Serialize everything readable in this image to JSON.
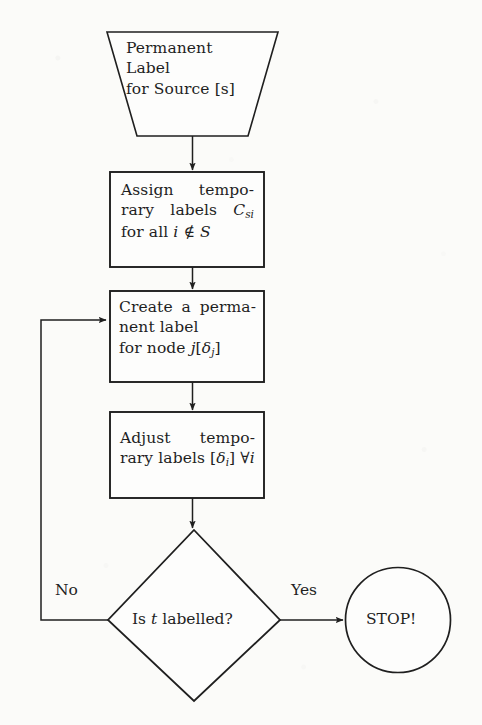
{
  "diagram": {
    "background_color": "#fbfbf9",
    "stroke_color": "#1f1f1f",
    "text_color": "#1f1f1f"
  },
  "nodes": {
    "start": {
      "shape": "trapezoid",
      "lines": [
        "Permanent",
        "Label",
        "for Source [s]"
      ],
      "line1": "Permanent",
      "line2": "Label",
      "line3": "for Source [s]"
    },
    "assign": {
      "shape": "rectangle",
      "line1_left": "Assign",
      "line1_right": "tempo-",
      "line2_left": "rary",
      "line2_mid": "labels",
      "line2_math_base": "C",
      "line2_math_sub": "si",
      "line3_pre": "for all ",
      "line3_math_i": "i",
      "line3_mid": " ∉ ",
      "line3_math_S": "S"
    },
    "create": {
      "shape": "rectangle",
      "line1_left": "Create",
      "line1_mid": "a",
      "line1_right": "perma-",
      "line2": "nent label",
      "line3_pre": "for node ",
      "line3_math_j": "j",
      "line3_bracket_open": "[",
      "line3_math_delta": "δ",
      "line3_math_delta_sub": "j",
      "line3_bracket_close": "]"
    },
    "adjust": {
      "shape": "rectangle",
      "line1_left": "Adjust",
      "line1_right": "tempo-",
      "line2_left": "rary",
      "line2_mid": "labels",
      "line2_bracket_open": "[",
      "line2_math_delta": "δ",
      "line2_math_delta_sub": "i",
      "line2_bracket_close": "]",
      "line2_forall": "∀",
      "line2_math_i": "i"
    },
    "decision": {
      "shape": "diamond",
      "text_pre": "Is ",
      "text_math_t": "t",
      "text_post": " labelled?"
    },
    "stop": {
      "shape": "circle",
      "label": "STOP!"
    }
  },
  "edges": {
    "start_to_assign": {
      "label": ""
    },
    "assign_to_create": {
      "label": ""
    },
    "create_to_adjust": {
      "label": ""
    },
    "adjust_to_decision": {
      "label": ""
    },
    "decision_no": {
      "label": "No",
      "direction": "left",
      "target": "create"
    },
    "decision_yes": {
      "label": "Yes",
      "direction": "right",
      "target": "stop"
    }
  }
}
